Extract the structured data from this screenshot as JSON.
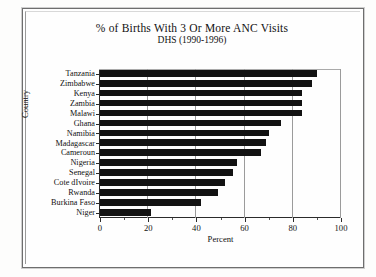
{
  "chart_data": {
    "type": "bar",
    "orientation": "horizontal",
    "title": "% of Births With 3 Or More ANC Visits",
    "subtitle": "DHS (1990-1996)",
    "xlabel": "Percent",
    "ylabel": "Country",
    "xlim": [
      0,
      100
    ],
    "xticks": [
      0,
      20,
      40,
      60,
      80,
      100
    ],
    "xticklabels": [
      "0",
      "20",
      "40",
      "60",
      "80",
      "100"
    ],
    "grid": true,
    "grid_axis": "x",
    "legend": null,
    "bar_color": "#121212",
    "categories": [
      "Tanzania",
      "Zimbabwe",
      "Kenya",
      "Zambia",
      "Malawi",
      "Ghana",
      "Namibia",
      "Madagascar",
      "Cameroun",
      "Nigeria",
      "Senegal",
      "Cote dIvoire",
      "Rwanda",
      "Burkina Faso",
      "Niger"
    ],
    "values": [
      90,
      88,
      84,
      84,
      84,
      75,
      70,
      69,
      67,
      57,
      55,
      52,
      49,
      42,
      21
    ]
  }
}
